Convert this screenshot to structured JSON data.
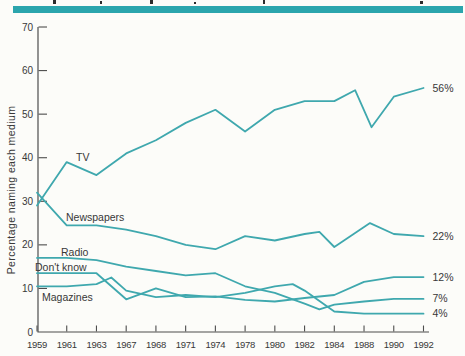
{
  "page": {
    "background": "#fcfcf9",
    "accent_bar_color": "#2ba5ad"
  },
  "chart_data": {
    "type": "line",
    "title": "",
    "ylabel": "Percentage naming each medium",
    "xlabel": "",
    "line_color": "#3fa8ae",
    "axis_color": "#4d4d4d",
    "text_color": "#383838",
    "grid": false,
    "legend_position": "inline-labels",
    "ylim": [
      0,
      70
    ],
    "yticks": [
      0,
      10,
      20,
      30,
      40,
      50,
      60,
      70
    ],
    "x_tick_labels": [
      "1959",
      "1961",
      "1963",
      "1967",
      "1968",
      "1971",
      "1974",
      "1978",
      "1980",
      "1982",
      "1984",
      "1988",
      "1990",
      "1992"
    ],
    "series": [
      {
        "name": "tv",
        "label": "TV",
        "end_label": "56%",
        "label_pos": {
          "x": 76,
          "y": 161
        },
        "points": [
          [
            0,
            29
          ],
          [
            1,
            39
          ],
          [
            2,
            36
          ],
          [
            3,
            41
          ],
          [
            4,
            44
          ],
          [
            5,
            48
          ],
          [
            6,
            51
          ],
          [
            7,
            46
          ],
          [
            8,
            51
          ],
          [
            9,
            53
          ],
          [
            10,
            53
          ],
          [
            10.7,
            55.5
          ],
          [
            11.25,
            47
          ],
          [
            12,
            54
          ],
          [
            13,
            56
          ]
        ]
      },
      {
        "name": "newspapers",
        "label": "Newspapers",
        "end_label": "22%",
        "label_pos": {
          "x": 66,
          "y": 221
        },
        "points": [
          [
            0,
            32
          ],
          [
            1,
            24.5
          ],
          [
            2,
            24.5
          ],
          [
            3,
            23.5
          ],
          [
            4,
            22
          ],
          [
            5,
            20
          ],
          [
            6,
            19
          ],
          [
            7,
            22
          ],
          [
            8,
            21
          ],
          [
            9,
            22.5
          ],
          [
            9.5,
            23
          ],
          [
            10,
            19.5
          ],
          [
            11.2,
            25
          ],
          [
            12,
            22.5
          ],
          [
            13,
            22
          ]
        ]
      },
      {
        "name": "radio",
        "label": "Radio",
        "end_label": "7%",
        "label_pos": {
          "x": 61,
          "y": 256
        },
        "points": [
          [
            0,
            17
          ],
          [
            1,
            17
          ],
          [
            2,
            16.5
          ],
          [
            3,
            15
          ],
          [
            4,
            14
          ],
          [
            5,
            13
          ],
          [
            6,
            13.5
          ],
          [
            7,
            10.5
          ],
          [
            8,
            9
          ],
          [
            9,
            6.5
          ],
          [
            9.5,
            5.2
          ],
          [
            10,
            6.3
          ],
          [
            11,
            7
          ],
          [
            12,
            7.6
          ],
          [
            13,
            7.6
          ]
        ]
      },
      {
        "name": "dont-know",
        "label": "Don't know",
        "end_label": "12%",
        "label_pos": {
          "x": 35,
          "y": 271
        },
        "points": [
          [
            0,
            13.5
          ],
          [
            1,
            13.5
          ],
          [
            2,
            13.5
          ],
          [
            3,
            7.5
          ],
          [
            4,
            10
          ],
          [
            5,
            8
          ],
          [
            6,
            8.2
          ],
          [
            7,
            7.4
          ],
          [
            8,
            7
          ],
          [
            9,
            7.8
          ],
          [
            10,
            8.5
          ],
          [
            11,
            11.5
          ],
          [
            12,
            12.6
          ],
          [
            13,
            12.6
          ]
        ]
      },
      {
        "name": "magazines",
        "label": "Magazines",
        "end_label": "4%",
        "label_pos": {
          "x": 42,
          "y": 301
        },
        "points": [
          [
            0,
            10.5
          ],
          [
            1,
            10.5
          ],
          [
            2,
            11
          ],
          [
            2.5,
            12.5
          ],
          [
            3,
            9.5
          ],
          [
            4,
            8
          ],
          [
            5,
            8.5
          ],
          [
            6,
            8
          ],
          [
            7,
            9
          ],
          [
            8,
            10.5
          ],
          [
            8.6,
            11
          ],
          [
            9,
            9.5
          ],
          [
            10,
            4.7
          ],
          [
            11,
            4.2
          ],
          [
            12,
            4.2
          ],
          [
            13,
            4.2
          ]
        ]
      }
    ]
  }
}
